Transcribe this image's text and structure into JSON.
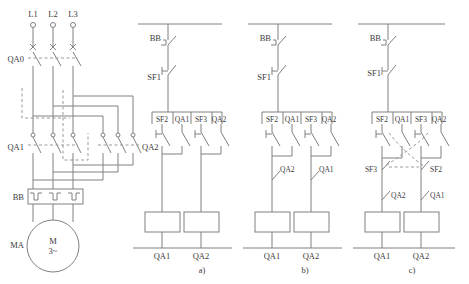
{
  "diagram": {
    "stroke_color": "#808080",
    "text_color": "#3a3a3a",
    "dash_color": "#9a9a9a"
  },
  "power_circuit": {
    "supply_terminals": [
      "L1",
      "L2",
      "L3"
    ],
    "main_switch_label": "QA0",
    "contactor_forward_label": "QA1",
    "contactor_reverse_label": "QA2",
    "overload_relay_label": "BB",
    "motor_designation_label": "MA",
    "motor_symbol_line1": "M",
    "motor_symbol_line2": "3~"
  },
  "control_circuits": [
    {
      "caption": "a)",
      "overload_contact_label": "BB",
      "stop_button_label": "SF1",
      "column_headers": [
        "SF2",
        "QA1",
        "SF3",
        "QA2"
      ],
      "left_branch": {
        "start_button_label": "SF2",
        "holding_contact_label": "QA1",
        "interlock_label": "",
        "auxiliary_label": "",
        "coil_label": "QA1"
      },
      "right_branch": {
        "start_button_label": "SF3",
        "holding_contact_label": "QA2",
        "interlock_label": "",
        "auxiliary_label": "",
        "coil_label": "QA2"
      },
      "bottom_labels": [
        "QA1",
        "QA2"
      ]
    },
    {
      "caption": "b)",
      "overload_contact_label": "BB",
      "stop_button_label": "SF1",
      "column_headers": [
        "SF2",
        "QA1",
        "SF3",
        "QA2"
      ],
      "left_branch": {
        "start_button_label": "SF2",
        "holding_contact_label": "QA1",
        "interlock_label": "QA2",
        "auxiliary_label": "",
        "coil_label": "QA1"
      },
      "right_branch": {
        "start_button_label": "SF3",
        "holding_contact_label": "QA2",
        "interlock_label": "QA1",
        "auxiliary_label": "",
        "coil_label": "QA2"
      },
      "bottom_labels": [
        "QA1",
        "QA2"
      ]
    },
    {
      "caption": "c)",
      "overload_contact_label": "BB",
      "stop_button_label": "SF1",
      "column_headers": [
        "SF2",
        "QA1",
        "SF3",
        "QA2"
      ],
      "left_branch": {
        "start_button_label": "SF2",
        "holding_contact_label": "QA1",
        "interlock_label": "SF3",
        "auxiliary_label": "QA2",
        "coil_label": "QA1"
      },
      "right_branch": {
        "start_button_label": "SF3",
        "holding_contact_label": "QA2",
        "interlock_label": "SF2",
        "auxiliary_label": "QA1",
        "coil_label": "QA2"
      },
      "bottom_labels": [
        "QA1",
        "QA2"
      ]
    }
  ]
}
